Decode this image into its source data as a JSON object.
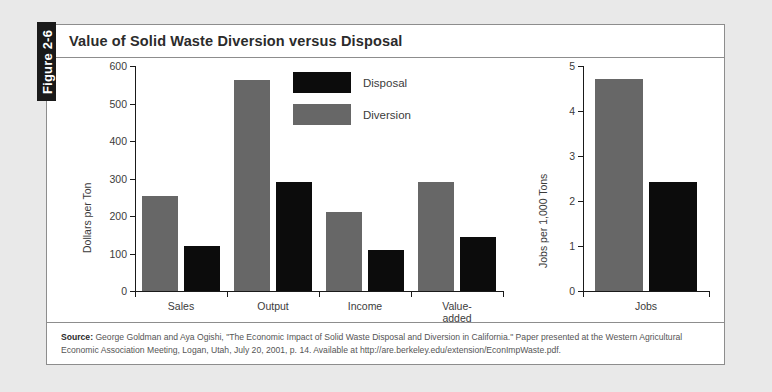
{
  "figure": {
    "tab_label": "Figure 2-6",
    "title": "Value of Solid Waste Diversion versus Disposal"
  },
  "source": {
    "label": "Source:",
    "text": "George Goldman and Aya Ogishi, \"The Economic Impact of Solid Waste Disposal and Diversion in California.\" Paper presented at the Western Agricultural Economic Association Meeting, Logan, Utah, July 20, 2001, p. 14. Available at http://are.berkeley.edu/extension/EconImpWaste.pdf."
  },
  "legend": {
    "items": [
      {
        "label": "Disposal",
        "color": "#0c0c0c"
      },
      {
        "label": "Diversion",
        "color": "#676767"
      }
    ]
  },
  "colors": {
    "disposal": "#0c0c0c",
    "diversion": "#676767",
    "axis": "#1a1a1a",
    "box_border": "#8d8d8d",
    "page_background": "#e9e9e9",
    "figure_background": "#ffffff",
    "tab_background": "#1a1a1a"
  },
  "chart_data": [
    {
      "type": "bar",
      "id": "dollars-per-ton",
      "title": "",
      "xlabel": "",
      "ylabel": "Dollars per Ton",
      "ylim": [
        0,
        600
      ],
      "yticks": [
        0,
        100,
        200,
        300,
        400,
        500,
        600
      ],
      "ytick_labels": [
        "0",
        "100",
        "200",
        "300",
        "400",
        "500",
        "600"
      ],
      "grid": false,
      "categories": [
        "Sales",
        "Output",
        "Income",
        "Value-added"
      ],
      "series": [
        {
          "name": "Diversion",
          "color": "#676767",
          "values": [
            253,
            563,
            210,
            290
          ]
        },
        {
          "name": "Disposal",
          "color": "#0c0c0c",
          "values": [
            120,
            290,
            109,
            143
          ]
        }
      ]
    },
    {
      "type": "bar",
      "id": "jobs-per-1000-tons",
      "title": "",
      "xlabel": "",
      "ylabel": "Jobs per 1,000 Tons",
      "ylim": [
        0,
        5
      ],
      "yticks": [
        0,
        1,
        2,
        3,
        4,
        5
      ],
      "ytick_labels": [
        "0",
        "1",
        "2",
        "3",
        "4",
        "5"
      ],
      "grid": false,
      "categories": [
        "Jobs"
      ],
      "series": [
        {
          "name": "Diversion",
          "color": "#676767",
          "values": [
            4.72
          ]
        },
        {
          "name": "Disposal",
          "color": "#0c0c0c",
          "values": [
            2.43
          ]
        }
      ]
    }
  ]
}
